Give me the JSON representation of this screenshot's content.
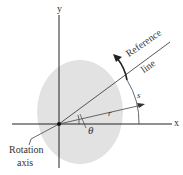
{
  "labels": {
    "x_axis": "x",
    "y_axis": "y",
    "reference_line": [
      "Reference",
      "line"
    ],
    "arc_length": "s",
    "radius": "r",
    "angle": "θ",
    "rotation_axis": [
      "Rotation",
      "axis"
    ]
  },
  "colors": {
    "body": "#e3e3e3",
    "line": "#333333",
    "axis": "#222222"
  }
}
